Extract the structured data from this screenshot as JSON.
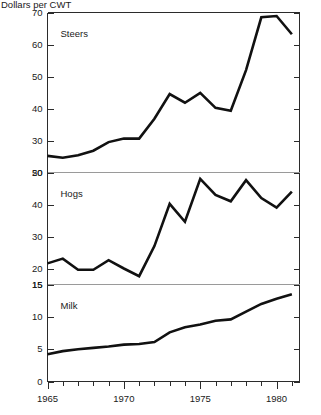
{
  "chart_data": {
    "type": "line",
    "title": "Dollars per CWT",
    "xlabel": "",
    "ylabel": "Dollars per CWT",
    "grid": false,
    "legend_position": "inside-panel",
    "x": [
      1965,
      1966,
      1967,
      1968,
      1969,
      1970,
      1971,
      1972,
      1973,
      1974,
      1975,
      1976,
      1977,
      1978,
      1979,
      1980,
      1981
    ],
    "xlim": [
      1965,
      1981.5
    ],
    "xticks_major": [
      1965,
      1970,
      1975,
      1980
    ],
    "xticklabels": [
      "1965",
      "1970",
      "1975",
      "1980"
    ],
    "panels": [
      {
        "name": "steers",
        "label": "Steers",
        "ylim": [
          20,
          70
        ],
        "yticks": [
          20,
          30,
          40,
          50,
          60,
          70
        ],
        "yticklabels": [
          "20",
          "30",
          "40",
          "50",
          "60",
          "70"
        ],
        "values": [
          25.2,
          24.6,
          25.4,
          26.8,
          29.5,
          30.6,
          30.6,
          36.8,
          44.5,
          41.8,
          44.9,
          40.2,
          39.3,
          52.0,
          68.5,
          68.9,
          63.2
        ]
      },
      {
        "name": "hogs",
        "label": "Hogs",
        "ylim": [
          15,
          50
        ],
        "yticks": [
          15,
          20,
          30,
          40,
          50
        ],
        "yticklabels": [
          "15",
          "20",
          "30",
          "40",
          "50"
        ],
        "values": [
          21.6,
          23.1,
          19.6,
          19.6,
          22.6,
          20.0,
          17.6,
          27.0,
          40.2,
          34.6,
          48.0,
          43.0,
          41.0,
          47.6,
          42.0,
          39.0,
          44.0
        ]
      },
      {
        "name": "milk",
        "label": "Milk",
        "ylim": [
          0,
          15
        ],
        "yticks": [
          0,
          5,
          10,
          15
        ],
        "yticklabels": [
          "0",
          "5",
          "10",
          "15"
        ],
        "values": [
          4.2,
          4.7,
          5.0,
          5.2,
          5.4,
          5.7,
          5.8,
          6.1,
          7.6,
          8.4,
          8.8,
          9.4,
          9.6,
          10.8,
          12.0,
          12.8,
          13.5
        ]
      }
    ]
  }
}
